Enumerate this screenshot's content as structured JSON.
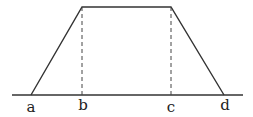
{
  "diagram": {
    "type": "trapezoid-membership-function",
    "labels": [
      {
        "text": "a",
        "x": 31
      },
      {
        "text": "b",
        "x": 83
      },
      {
        "text": "c",
        "x": 171
      },
      {
        "text": "d",
        "x": 225
      }
    ],
    "colors": {
      "stroke": "#333333",
      "dash": "#444444",
      "text": "#222222"
    }
  }
}
